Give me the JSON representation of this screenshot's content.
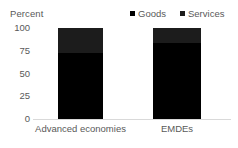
{
  "chart_data": {
    "type": "bar",
    "stacked": true,
    "title": "",
    "subtitle": "",
    "xlabel": "",
    "ylabel": "Percent",
    "ylim": [
      0,
      100
    ],
    "yticks": [
      "0",
      "25",
      "50",
      "75",
      "100"
    ],
    "ytick_values": [
      0,
      25,
      50,
      75,
      100
    ],
    "grid": false,
    "legend_position": "top-right",
    "categories": [
      "Advanced economies",
      "EMDEs"
    ],
    "series": [
      {
        "name": "Goods",
        "values": [
          73,
          83
        ],
        "color": "#000000"
      },
      {
        "name": "Services",
        "values": [
          27,
          17
        ],
        "color": "#1c1c1c"
      }
    ],
    "annotations": []
  },
  "axis": {
    "y_title": "Percent"
  },
  "legend": {
    "items": [
      {
        "label": "Goods",
        "marker": "square-marker"
      },
      {
        "label": "Services",
        "marker": "square-marker"
      }
    ]
  },
  "colors": {
    "goods": "#000000",
    "services": "#1c1c1c",
    "baseline": "#d9d9d9",
    "text": "#595959",
    "background": "#ffffff"
  }
}
